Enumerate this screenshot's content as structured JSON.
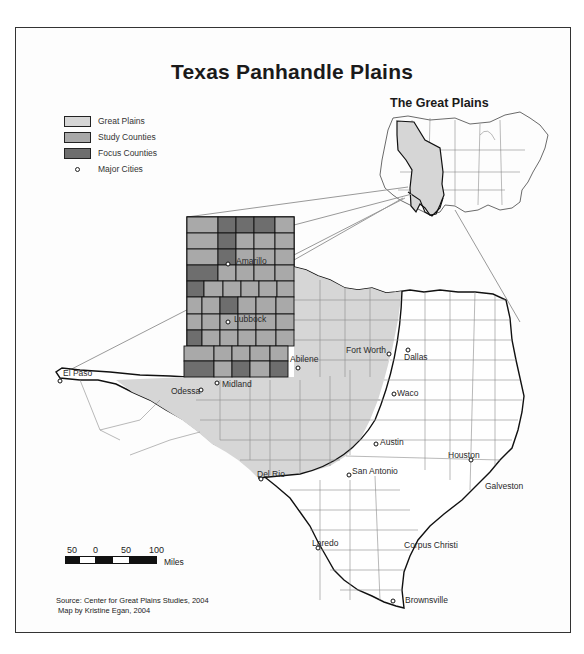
{
  "map": {
    "title": "Texas Panhandle Plains",
    "inset_title": "The Great Plains",
    "legend": [
      {
        "label": "Great Plains",
        "color": "#d6d6d6",
        "type": "swatch"
      },
      {
        "label": "Study Counties",
        "color": "#a9a9a9",
        "type": "swatch"
      },
      {
        "label": "Focus Counties",
        "color": "#6e6e6e",
        "type": "swatch"
      },
      {
        "label": "Major Cities",
        "type": "point"
      }
    ],
    "cities": [
      {
        "name": "Amarillo",
        "x": 228,
        "y": 264
      },
      {
        "name": "Lubbock",
        "x": 228,
        "y": 322
      },
      {
        "name": "El Paso",
        "x": 60,
        "y": 381
      },
      {
        "name": "Odessa",
        "x": 201,
        "y": 390
      },
      {
        "name": "Midland",
        "x": 217,
        "y": 383
      },
      {
        "name": "Abilene",
        "x": 298,
        "y": 368
      },
      {
        "name": "Fort Worth",
        "x": 389,
        "y": 354
      },
      {
        "name": "Dallas",
        "x": 408,
        "y": 350
      },
      {
        "name": "Waco",
        "x": 394,
        "y": 394
      },
      {
        "name": "Austin",
        "x": 376,
        "y": 444
      },
      {
        "name": "Houston",
        "x": 471,
        "y": 460
      },
      {
        "name": "Galveston",
        "x": 484,
        "y": 480
      },
      {
        "name": "San Antonio",
        "x": 349,
        "y": 475
      },
      {
        "name": "Del Rio",
        "x": 261,
        "y": 479
      },
      {
        "name": "Laredo",
        "x": 318,
        "y": 548
      },
      {
        "name": "Corpus Christi",
        "x": 401,
        "y": 545
      },
      {
        "name": "Brownsville",
        "x": 393,
        "y": 601
      }
    ],
    "scale_bar": {
      "ticks": [
        "50",
        "0",
        "50",
        "100"
      ],
      "unit": "Miles"
    },
    "source": "Source: Center for Great Plains Studies, 2004",
    "author": "Map by Kristine Egan, 2004",
    "colors": {
      "great_plains": "#d6d6d6",
      "study": "#a9a9a9",
      "focus": "#6e6e6e",
      "border": "#111111",
      "county_line": "#8a8a8a"
    }
  }
}
